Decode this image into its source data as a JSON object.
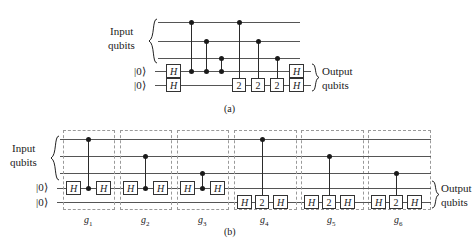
{
  "figure": {
    "panel_a_label": "(a)",
    "panel_b_label": "(b)",
    "input_qubits_line1": "Input",
    "input_qubits_line2": "qubits",
    "output_qubits_line1": "Output",
    "output_qubits_line2": "qubits",
    "ket_zero": "|0⟩",
    "gate_h": "H",
    "gate_two": "2",
    "colors": {
      "wire": "#555555",
      "gate_border": "#333333",
      "dot": "#1a1a1a",
      "block_dash": "#9a9a9a",
      "background": "#ffffff"
    }
  },
  "panel_a": {
    "label": "(a)",
    "input_brace_label_1": "Input",
    "input_brace_label_2": "qubits",
    "output_brace_label_1": "Output",
    "output_brace_label_2": "qubits",
    "num_input_wires": 3,
    "num_ancilla_wires": 2,
    "ancilla_init": [
      "|0⟩",
      "|0⟩"
    ],
    "ancilla_first_gates": [
      "H",
      "H"
    ],
    "ancilla_last_gates": [
      "H",
      "H"
    ],
    "controlled_ops": [
      {
        "control_wire": 1,
        "target_wire": 4,
        "target_symbol": "dot"
      },
      {
        "control_wire": 2,
        "target_wire": 4,
        "target_symbol": "dot"
      },
      {
        "control_wire": 3,
        "target_wire": 4,
        "target_symbol": "dot"
      },
      {
        "control_wire": 1,
        "target_wire": 5,
        "target_symbol": "2"
      },
      {
        "control_wire": 2,
        "target_wire": 5,
        "target_symbol": "2"
      },
      {
        "control_wire": 3,
        "target_wire": 5,
        "target_symbol": "2"
      }
    ]
  },
  "panel_b": {
    "label": "(b)",
    "input_brace_label_1": "Input",
    "input_brace_label_2": "qubits",
    "output_brace_label_1": "Output",
    "output_brace_label_2": "qubits",
    "num_input_wires": 3,
    "num_ancilla_wires": 2,
    "ancilla_init": [
      "|0⟩",
      "|0⟩"
    ],
    "blocks": [
      {
        "name": "g",
        "sub": "1",
        "control_wire": 1,
        "target_wire": 4,
        "gates": [
          "H",
          "dot",
          "H"
        ]
      },
      {
        "name": "g",
        "sub": "2",
        "control_wire": 2,
        "target_wire": 4,
        "gates": [
          "H",
          "dot",
          "H"
        ]
      },
      {
        "name": "g",
        "sub": "3",
        "control_wire": 3,
        "target_wire": 4,
        "gates": [
          "H",
          "dot",
          "H"
        ]
      },
      {
        "name": "g",
        "sub": "4",
        "control_wire": 1,
        "target_wire": 5,
        "gates": [
          "H",
          "2",
          "H"
        ]
      },
      {
        "name": "g",
        "sub": "5",
        "control_wire": 2,
        "target_wire": 5,
        "gates": [
          "H",
          "2",
          "H"
        ]
      },
      {
        "name": "g",
        "sub": "6",
        "control_wire": 3,
        "target_wire": 5,
        "gates": [
          "H",
          "2",
          "H"
        ]
      }
    ]
  }
}
